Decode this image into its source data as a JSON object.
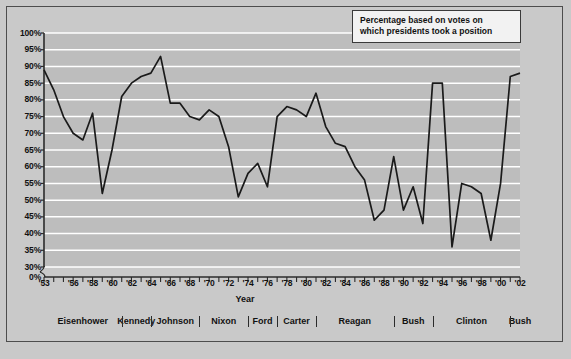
{
  "annotation": {
    "line1": "Percentage based on votes on",
    "line2": "which presidents took a position"
  },
  "axis": {
    "x_title": "Year",
    "y_ticks": [
      "100%",
      "95%",
      "90%",
      "85%",
      "80%",
      "75%",
      "70%",
      "65%",
      "60%",
      "55%",
      "50%",
      "45%",
      "40%",
      "35%",
      "30%",
      "0%"
    ],
    "x_ticks": [
      "'53",
      "'56",
      "'58",
      "'60",
      "'62",
      "'64",
      "'66",
      "'68",
      "'70",
      "'72",
      "'74",
      "'76",
      "'78",
      "'80",
      "'82",
      "'84",
      "'86",
      "'88",
      "'90",
      "'92",
      "'94",
      "'96",
      "'98",
      "'00",
      "'02"
    ]
  },
  "presidents": [
    {
      "name": "Eisenhower",
      "start": 1953,
      "end": 1961
    },
    {
      "name": "Kennedy",
      "start": 1961,
      "end": 1964
    },
    {
      "name": "Johnson",
      "start": 1964,
      "end": 1969
    },
    {
      "name": "Nixon",
      "start": 1969,
      "end": 1974
    },
    {
      "name": "Ford",
      "start": 1974,
      "end": 1977
    },
    {
      "name": "Carter",
      "start": 1977,
      "end": 1981
    },
    {
      "name": "Reagan",
      "start": 1981,
      "end": 1989
    },
    {
      "name": "Bush",
      "start": 1989,
      "end": 1993
    },
    {
      "name": "Clinton",
      "start": 1993,
      "end": 2001
    },
    {
      "name": "Bush",
      "start": 2001,
      "end": 2003
    }
  ],
  "chart_data": {
    "type": "line",
    "title": "",
    "xlabel": "Year",
    "ylabel": "",
    "xlim": [
      1953,
      2002
    ],
    "ylim": [
      30,
      100
    ],
    "y_axis_break": true,
    "grid": true,
    "legend": false,
    "line_color": "#1a1a1a",
    "plot_bg": "#bdbdbd",
    "gridline_color": "#ffffff",
    "x": [
      1953,
      1954,
      1955,
      1956,
      1957,
      1958,
      1959,
      1960,
      1961,
      1962,
      1963,
      1964,
      1965,
      1966,
      1967,
      1968,
      1969,
      1970,
      1971,
      1972,
      1973,
      1974,
      1975,
      1976,
      1977,
      1978,
      1979,
      1980,
      1981,
      1982,
      1983,
      1984,
      1985,
      1986,
      1987,
      1988,
      1989,
      1990,
      1991,
      1992,
      1993,
      1994,
      1995,
      1996,
      1997,
      1998,
      1999,
      2000,
      2001,
      2002
    ],
    "values": [
      89,
      83,
      75,
      70,
      68,
      76,
      52,
      65,
      81,
      85,
      87,
      88,
      93,
      79,
      79,
      75,
      74,
      77,
      75,
      66,
      51,
      58,
      61,
      54,
      75,
      78,
      77,
      75,
      82,
      72,
      67,
      66,
      60,
      56,
      44,
      47,
      63,
      47,
      54,
      43,
      85,
      85,
      36,
      55,
      54,
      52,
      38,
      55,
      87,
      88
    ],
    "annotation": "Percentage based on votes on which presidents took a position"
  }
}
